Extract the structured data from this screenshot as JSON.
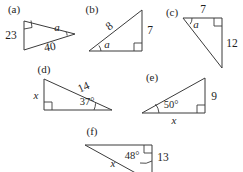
{
  "page": {
    "width": 243,
    "height": 172,
    "background_color": "#ffffff",
    "line_color": "#3b3b3b",
    "text_color": "#1e1e1e"
  },
  "figures": [
    {
      "id": "a",
      "part_label": "(a)",
      "right_angle_vertex": "top-left",
      "labels": {
        "left_leg": "23",
        "hypotenuse": "40",
        "angle": "a"
      }
    },
    {
      "id": "b",
      "part_label": "(b)",
      "right_angle_vertex": "bottom-right",
      "labels": {
        "hypotenuse": "8",
        "right_leg": "7",
        "angle": "a"
      }
    },
    {
      "id": "c",
      "part_label": "(c)",
      "right_angle_vertex": "top-right",
      "labels": {
        "top_leg": "7",
        "right_leg": "12",
        "angle": "a"
      }
    },
    {
      "id": "d",
      "part_label": "(d)",
      "right_angle_vertex": "bottom-left",
      "labels": {
        "left_leg": "x",
        "hypotenuse": "14",
        "angle": "37°"
      }
    },
    {
      "id": "e",
      "part_label": "(e)",
      "right_angle_vertex": "bottom-right",
      "labels": {
        "right_leg": "9",
        "bottom_leg": "x",
        "angle": "50°"
      }
    },
    {
      "id": "f",
      "part_label": "(f)",
      "right_angle_vertex": "top-right",
      "labels": {
        "right_leg": "13",
        "hypotenuse": "x",
        "angle": "48°"
      }
    }
  ]
}
